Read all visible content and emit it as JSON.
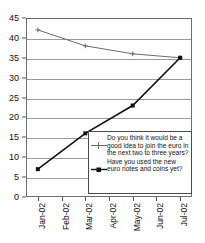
{
  "chart_data": {
    "type": "line",
    "title": "",
    "subtitle": "",
    "xlabel": "",
    "ylabel": "",
    "categories": [
      "Jan-02",
      "Feb-02",
      "Mar-02",
      "Apr-02",
      "May-02",
      "Jun-02",
      "Jul-02"
    ],
    "ylim": [
      0,
      45
    ],
    "yticks": [
      0,
      5,
      10,
      15,
      20,
      25,
      30,
      35,
      40,
      45
    ],
    "grid": true,
    "legend_position": "inside-bottom-right",
    "series": [
      {
        "name": "Do you think it would be a good idea to join the euro in the next two to three years?",
        "color": "#6b6b6b",
        "marker": "plus",
        "x": [
          "Jan-02",
          "Mar-02",
          "May-02",
          "Jul-02"
        ],
        "values": [
          42,
          38,
          36,
          35
        ]
      },
      {
        "name": "Have you used the new euro notes and coins yet?",
        "color": "#111111",
        "marker": "square",
        "x": [
          "Jan-02",
          "Mar-02",
          "May-02",
          "Jul-02"
        ],
        "values": [
          7,
          16,
          23,
          35
        ]
      }
    ]
  },
  "axes": {
    "y_tick_labels": [
      "45",
      "40",
      "35",
      "30",
      "25",
      "20",
      "15",
      "10",
      "5",
      "0"
    ],
    "x_tick_labels": [
      "Jan-02",
      "Feb-02",
      "Mar-02",
      "Apr-02",
      "May-02",
      "Jun-02",
      "Jul-02"
    ]
  },
  "legend": {
    "entries": [
      {
        "label": "Do you think it would be a good idea to join the euro in the next two to three years?",
        "marker": "plus-line-gray"
      },
      {
        "label": "Have you used the new euro notes and coins yet?",
        "marker": "square-line-black"
      }
    ]
  },
  "colors": {
    "series_gray": "#6b6b6b",
    "series_black": "#111111",
    "grid": "#9a9a9a",
    "frame": "#6e6e6e",
    "background": "#ffffff"
  }
}
